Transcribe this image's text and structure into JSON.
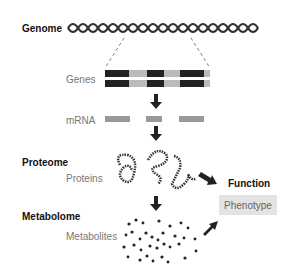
{
  "labels": {
    "genome": "Genome",
    "genes": "Genes",
    "mrna": "mRNA",
    "proteome": "Proteome",
    "proteins": "Proteins",
    "function": "Function",
    "phenotype": "Phenotype",
    "metabolome": "Metabolome",
    "metabolites": "Metabolites"
  },
  "colors": {
    "dark": "#222222",
    "gray_label": "#777777",
    "mrna_bar": "#999999",
    "phenotype_box": "#e3e3e3"
  }
}
